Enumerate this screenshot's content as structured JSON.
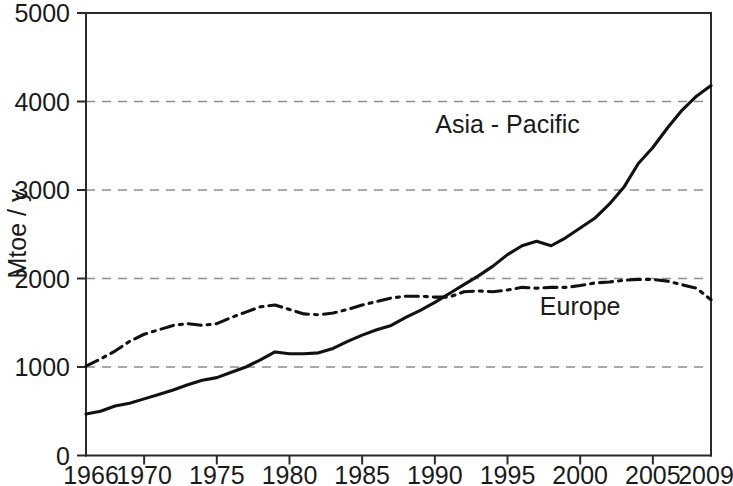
{
  "chart_data": {
    "type": "line",
    "title": "",
    "subtitle": "",
    "xlabel": "",
    "ylabel": "Mtoe / y",
    "xlim": [
      1966,
      2009
    ],
    "ylim": [
      0,
      5000
    ],
    "grid": "horizontal-dashed",
    "legend_position": "inline-annotations",
    "y_ticks": [
      0,
      1000,
      2000,
      3000,
      4000,
      5000
    ],
    "y_tick_labels": [
      "0",
      "1000",
      "2000",
      "3000",
      "4000",
      "5000"
    ],
    "x_ticks": [
      1966,
      1970,
      1975,
      1980,
      1985,
      1990,
      1995,
      2000,
      2005,
      2009
    ],
    "x_tick_labels": [
      "1966",
      "1970",
      "1975",
      "1980",
      "1985",
      "1990",
      "1995",
      "2000",
      "2005",
      "2009"
    ],
    "x": [
      1966,
      1967,
      1968,
      1969,
      1970,
      1971,
      1972,
      1973,
      1974,
      1975,
      1976,
      1977,
      1978,
      1979,
      1980,
      1981,
      1982,
      1983,
      1984,
      1985,
      1986,
      1987,
      1988,
      1989,
      1990,
      1991,
      1992,
      1993,
      1994,
      1995,
      1996,
      1997,
      1998,
      1999,
      2000,
      2001,
      2002,
      2003,
      2004,
      2005,
      2006,
      2007,
      2008,
      2009
    ],
    "series": [
      {
        "name": "Asia - Pacific",
        "style": "solid",
        "color": "#111111",
        "label_x": 1995,
        "label_y": 3640,
        "values": [
          470,
          500,
          560,
          590,
          640,
          690,
          740,
          800,
          850,
          880,
          940,
          1000,
          1080,
          1170,
          1150,
          1150,
          1160,
          1210,
          1290,
          1360,
          1420,
          1470,
          1560,
          1640,
          1730,
          1830,
          1930,
          2030,
          2140,
          2270,
          2370,
          2420,
          2370,
          2460,
          2570,
          2680,
          2840,
          3030,
          3300,
          3480,
          3700,
          3900,
          4060,
          4180
        ]
      },
      {
        "name": "Europe",
        "style": "dash-dot",
        "color": "#111111",
        "label_x": 2000,
        "label_y": 1590,
        "values": [
          1010,
          1090,
          1180,
          1290,
          1370,
          1420,
          1470,
          1490,
          1470,
          1490,
          1560,
          1620,
          1680,
          1700,
          1650,
          1600,
          1590,
          1610,
          1650,
          1700,
          1740,
          1780,
          1800,
          1800,
          1790,
          1790,
          1850,
          1860,
          1850,
          1870,
          1900,
          1890,
          1900,
          1900,
          1920,
          1950,
          1960,
          1980,
          1990,
          1990,
          1970,
          1930,
          1890,
          1760
        ]
      }
    ]
  }
}
